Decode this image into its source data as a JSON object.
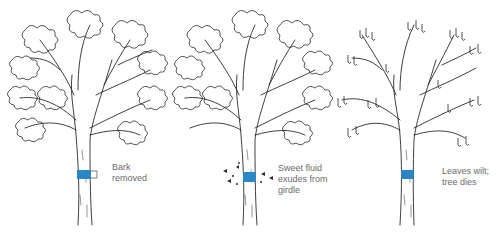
{
  "figure": {
    "colors": {
      "ink": "#2a2a2a",
      "girdle": "#2a86c4",
      "caption": "#6b6b6b"
    },
    "panels": [
      {
        "id": "stage-1",
        "caption": "Bark\nremoved",
        "leaves": "healthy",
        "exudate": false
      },
      {
        "id": "stage-2",
        "caption": "Sweet fluid\nexudes from\ngirdle",
        "leaves": "healthy",
        "exudate": true
      },
      {
        "id": "stage-3",
        "caption": "Leaves wilt;\ntree dies",
        "leaves": "wilted",
        "exudate": false
      }
    ]
  }
}
